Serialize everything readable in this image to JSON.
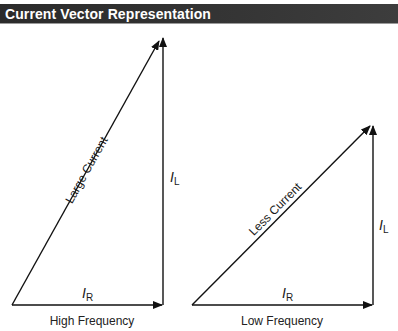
{
  "header": {
    "title": "Current Vector Representation",
    "background": "#333333",
    "text_color": "#ffffff"
  },
  "diagrams": [
    {
      "caption": "High Frequency",
      "hypotenuse_label": "Large Current",
      "vertical_label_main": "I",
      "vertical_label_sub": "L",
      "horizontal_label_main": "I",
      "horizontal_label_sub": "R"
    },
    {
      "caption": "Low Frequency",
      "hypotenuse_label": "Less Current",
      "vertical_label_main": "I",
      "vertical_label_sub": "L",
      "horizontal_label_main": "I",
      "horizontal_label_sub": "R"
    }
  ],
  "colors": {
    "line": "#111111"
  }
}
